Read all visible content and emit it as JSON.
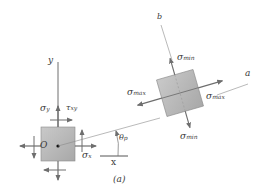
{
  "figure": {
    "caption": "(a)",
    "colors": {
      "element_fill": "#b5b5b5",
      "element_stroke": "#8a8a8a",
      "arrow": "#6e6e6e",
      "axis": "#555555",
      "text": "#3a3a3a"
    },
    "left_element": {
      "origin_label": "O",
      "y_axis_label": "y",
      "x_axis_label": "x",
      "sigma_y": {
        "symbol": "σ",
        "sub": "y"
      },
      "tau_xy": {
        "symbol": "τ",
        "sub": "xy"
      },
      "sigma_x": {
        "symbol": "σ",
        "sub": "x"
      }
    },
    "angle": {
      "symbol": "θ",
      "sub": "p"
    },
    "rotated_element": {
      "a_axis_label": "a",
      "b_axis_label": "b",
      "sigma_max_left": {
        "symbol": "σ",
        "sub": "max"
      },
      "sigma_max_right": {
        "symbol": "σ",
        "sub": "max"
      },
      "sigma_min_top": {
        "symbol": "σ",
        "sub": "min"
      },
      "sigma_min_bottom": {
        "symbol": "σ",
        "sub": "min"
      }
    }
  }
}
